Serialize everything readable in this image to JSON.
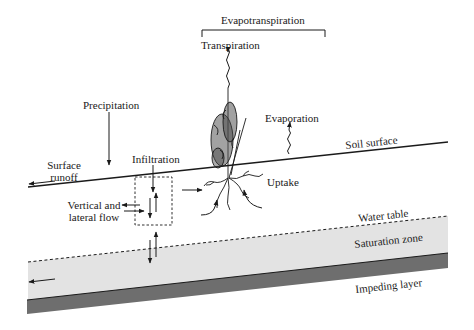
{
  "labels": {
    "evapotranspiration": "Evapotranspiration",
    "transpiration": "Transpiration",
    "precipitation": "Precipitation",
    "evaporation": "Evaporation",
    "soil_surface": "Soil surface",
    "surface_runoff_line1": "Surface",
    "surface_runoff_line2": "runoff",
    "infiltration": "Infiltration",
    "uptake": "Uptake",
    "vertical_lateral_line1": "Vertical and",
    "vertical_lateral_line2": "lateral flow",
    "water_table": "Water table",
    "saturation_zone": "Saturation zone",
    "impeding_layer": "Impeding layer"
  },
  "colors": {
    "line": "#1a1a1a",
    "saturation_fill": "#e3e3e3",
    "impeding_fill": "#6e6e6e",
    "background": "#ffffff"
  }
}
